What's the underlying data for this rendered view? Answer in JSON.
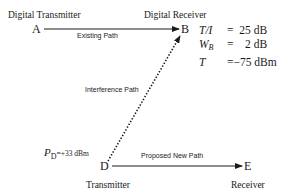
{
  "nodes": {
    "A": {
      "letter": "A",
      "label": "Digital Transmitter"
    },
    "B": {
      "letter": "B",
      "label": "Digital Receiver"
    },
    "D": {
      "letter": "D",
      "label": "Transmitter"
    },
    "E": {
      "letter": "E",
      "label": "Receiver"
    }
  },
  "paths": {
    "existing": "Existing Path",
    "interference": "Interference Path",
    "proposed": "Proposed New Path"
  },
  "parameters": [
    {
      "symbol": "T/I",
      "sub": "",
      "eq": "=",
      "value": "25 dB"
    },
    {
      "symbol": "W",
      "sub": "B",
      "eq": "=",
      "value": "2 dB"
    },
    {
      "symbol": "T",
      "sub": "",
      "eq": "=",
      "value": "−75 dBm"
    }
  ],
  "power": {
    "symbol": "P",
    "sub": "D",
    "eq": "=",
    "value": "+33 dBm"
  }
}
